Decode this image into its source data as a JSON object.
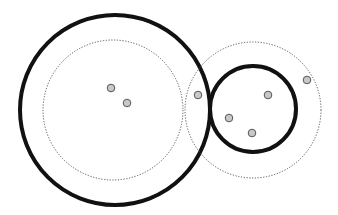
{
  "diagram": {
    "colors": {
      "background": "#ffffff",
      "solid_stroke": "#111111",
      "dotted_stroke": "#555555",
      "point_fill": "#c8c8c8",
      "point_stroke": "#555555"
    },
    "clusters": [
      {
        "name": "left-cluster",
        "points_inside": 2
      },
      {
        "name": "right-cluster",
        "points_inside": 3
      }
    ],
    "total_points": 7
  }
}
